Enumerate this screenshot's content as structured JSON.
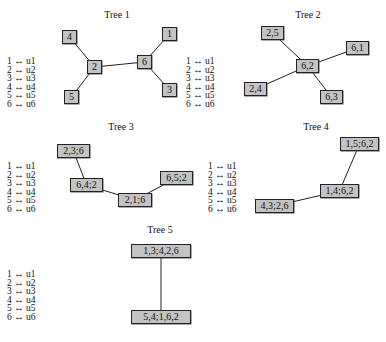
{
  "colors": {
    "node_fill": "#c3c3c3",
    "node_border": "#222222",
    "edge": "#222222",
    "background": "#ffffff"
  },
  "legend_lines": [
    "1 ↔ u1",
    "2 ↔ u2",
    "3 ↔ u3",
    "4 ↔ u4",
    "5 ↔ u5",
    "6 ↔ u6"
  ],
  "trees": [
    {
      "title": "Tree 1",
      "title_pos": [
        117,
        10
      ],
      "legend_pos": [
        7,
        57
      ],
      "nodes": [
        {
          "id": "4",
          "label": "4",
          "box": [
            62,
            30,
            15,
            14
          ]
        },
        {
          "id": "2",
          "label": "2",
          "box": [
            87,
            60,
            15,
            14
          ]
        },
        {
          "id": "6",
          "label": "6",
          "box": [
            137,
            55,
            15,
            14
          ]
        },
        {
          "id": "1",
          "label": "1",
          "box": [
            162,
            27,
            15,
            14
          ]
        },
        {
          "id": "3",
          "label": "3",
          "box": [
            162,
            83,
            15,
            14
          ]
        },
        {
          "id": "5",
          "label": "5",
          "box": [
            64,
            90,
            15,
            14
          ]
        }
      ],
      "edges": [
        [
          "4",
          "2"
        ],
        [
          "5",
          "2"
        ],
        [
          "2",
          "6"
        ],
        [
          "6",
          "1"
        ],
        [
          "6",
          "3"
        ]
      ]
    },
    {
      "title": "Tree 2",
      "title_pos": [
        308,
        10
      ],
      "legend_pos": [
        186,
        57
      ],
      "nodes": [
        {
          "id": "25",
          "label": "2,5",
          "box": [
            261,
            26,
            23,
            14
          ]
        },
        {
          "id": "62",
          "label": "6,2",
          "box": [
            296,
            59,
            23,
            14
          ]
        },
        {
          "id": "61",
          "label": "6,1",
          "box": [
            346,
            41,
            23,
            14
          ]
        },
        {
          "id": "24",
          "label": "2,4",
          "box": [
            244,
            82,
            23,
            14
          ]
        },
        {
          "id": "63",
          "label": "6,3",
          "box": [
            320,
            90,
            23,
            14
          ]
        }
      ],
      "edges": [
        [
          "25",
          "62"
        ],
        [
          "62",
          "61"
        ],
        [
          "62",
          "24"
        ],
        [
          "62",
          "63"
        ]
      ]
    },
    {
      "title": "Tree 3",
      "title_pos": [
        121,
        122
      ],
      "legend_pos": [
        7,
        162
      ],
      "nodes": [
        {
          "id": "a",
          "label": "2,3;6",
          "box": [
            57,
            144,
            33,
            14
          ]
        },
        {
          "id": "b",
          "label": "6,4;2",
          "box": [
            70,
            178,
            33,
            14
          ]
        },
        {
          "id": "c",
          "label": "2,1;6",
          "box": [
            118,
            193,
            34,
            14
          ]
        },
        {
          "id": "d",
          "label": "6,5;2",
          "box": [
            160,
            171,
            33,
            14
          ]
        }
      ],
      "edges": [
        [
          "a",
          "b"
        ],
        [
          "b",
          "c"
        ],
        [
          "c",
          "d"
        ]
      ]
    },
    {
      "title": "Tree 4",
      "title_pos": [
        316,
        122
      ],
      "legend_pos": [
        208,
        162
      ],
      "nodes": [
        {
          "id": "a",
          "label": "1,5;6,2",
          "box": [
            340,
            137,
            39,
            14
          ]
        },
        {
          "id": "b",
          "label": "1,4;6,2",
          "box": [
            320,
            184,
            39,
            14
          ]
        },
        {
          "id": "c",
          "label": "4,3;2,6",
          "box": [
            255,
            199,
            39,
            14
          ]
        }
      ],
      "edges": [
        [
          "a",
          "b"
        ],
        [
          "b",
          "c"
        ]
      ]
    },
    {
      "title": "Tree 5",
      "title_pos": [
        160,
        225
      ],
      "legend_pos": [
        7,
        270
      ],
      "nodes": [
        {
          "id": "a",
          "label": "1,3;4,2,6",
          "box": [
            131,
            244,
            60,
            14
          ]
        },
        {
          "id": "b",
          "label": "5,4;1,6,2",
          "box": [
            131,
            310,
            60,
            14
          ]
        }
      ],
      "edges": [
        [
          "a",
          "b"
        ]
      ]
    }
  ]
}
